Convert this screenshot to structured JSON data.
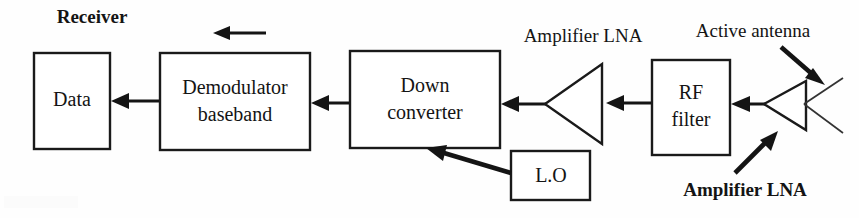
{
  "diagram": {
    "title": "Receiver",
    "section_label": "Receiver",
    "blocks": [
      {
        "id": "data",
        "label_line1": "Data",
        "label_line2": ""
      },
      {
        "id": "demodulator",
        "label_line1": "Demodulator",
        "label_line2": "baseband"
      },
      {
        "id": "downconverter",
        "label_line1": "Down",
        "label_line2": "converter"
      },
      {
        "id": "local_osc",
        "label_line1": "L.O",
        "label_line2": ""
      },
      {
        "id": "rf_filter",
        "label_line1": "RF",
        "label_line2": "filter"
      }
    ],
    "amplifiers": [
      {
        "id": "lna_chain",
        "label": "Amplifier LNA",
        "bold": false
      },
      {
        "id": "lna_antenna",
        "label": "Amplifier LNA",
        "bold": true
      }
    ],
    "annotations": [
      {
        "id": "active_antenna",
        "label": "Active antenna",
        "bold": false
      }
    ],
    "signal_flow_note": "",
    "colors": {
      "line": "#141414",
      "box_fill": "#ffffff",
      "background": "#fefefe",
      "antenna_wire": "#333333"
    }
  }
}
